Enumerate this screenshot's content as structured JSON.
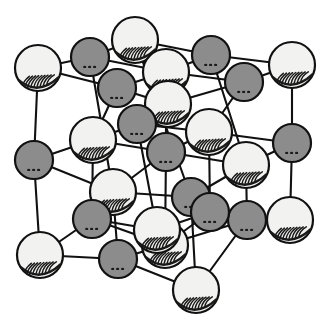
{
  "figure": {
    "background_color": "#ffffff",
    "line_color": "#111111",
    "projection": {
      "origin_x": 40,
      "origin_y": 255,
      "step_x": 78,
      "step_y": -96,
      "depth_dx": 46,
      "depth_dy": -48
    }
  },
  "species": [
    {
      "id": "anion",
      "label": "large light sphere",
      "fill_color": "#f2f2f0",
      "stroke_color": "#111111",
      "shade_color": "#1a1a1a",
      "radius": 23
    },
    {
      "id": "cation",
      "label": "small dark sphere",
      "fill_color": "#8c8c8c",
      "stroke_color": "#111111",
      "shade_color": "#1a1a1a",
      "radius": 19
    }
  ],
  "lattice": {
    "size_i": 3,
    "size_j": 3,
    "size_k": 3,
    "atom_count": 27,
    "bond_count": 54,
    "parity_rule": "sum of indices even -> anion (light), odd -> cation (dark)"
  },
  "atoms": [
    {
      "i": 0,
      "j": 0,
      "k": 0,
      "species": "anion",
      "x": 40,
      "y": 255
    },
    {
      "i": 1,
      "j": 0,
      "k": 0,
      "species": "cation",
      "x": 118,
      "y": 259
    },
    {
      "i": 2,
      "j": 0,
      "k": 0,
      "species": "anion",
      "x": 196,
      "y": 290
    },
    {
      "i": 0,
      "j": 1,
      "k": 0,
      "species": "cation",
      "x": 34,
      "y": 160
    },
    {
      "i": 1,
      "j": 1,
      "k": 0,
      "species": "anion",
      "x": 113,
      "y": 192
    },
    {
      "i": 2,
      "j": 1,
      "k": 0,
      "species": "cation",
      "x": 191,
      "y": 197
    },
    {
      "i": 0,
      "j": 2,
      "k": 0,
      "species": "anion",
      "x": 38,
      "y": 68
    },
    {
      "i": 1,
      "j": 2,
      "k": 0,
      "species": "cation",
      "x": 90,
      "y": 57
    },
    {
      "i": 2,
      "j": 2,
      "k": 0,
      "species": "anion",
      "x": 135,
      "y": 40
    },
    {
      "i": 0,
      "j": 0,
      "k": 1,
      "species": "cation",
      "x": 92,
      "y": 219
    },
    {
      "i": 1,
      "j": 0,
      "k": 1,
      "species": "anion",
      "x": 165,
      "y": 245
    },
    {
      "i": 2,
      "j": 0,
      "k": 1,
      "species": "cation",
      "x": 247,
      "y": 220
    },
    {
      "i": 0,
      "j": 1,
      "k": 1,
      "species": "anion",
      "x": 93,
      "y": 140
    },
    {
      "i": 1,
      "j": 1,
      "k": 1,
      "species": "cation",
      "x": 166,
      "y": 152
    },
    {
      "i": 2,
      "j": 1,
      "k": 1,
      "species": "anion",
      "x": 246,
      "y": 165
    },
    {
      "i": 0,
      "j": 2,
      "k": 1,
      "species": "cation",
      "x": 117,
      "y": 88
    },
    {
      "i": 1,
      "j": 2,
      "k": 1,
      "species": "anion",
      "x": 166,
      "y": 72
    },
    {
      "i": 2,
      "j": 2,
      "k": 1,
      "species": "cation",
      "x": 211,
      "y": 55
    },
    {
      "i": 0,
      "j": 0,
      "k": 2,
      "species": "anion",
      "x": 157,
      "y": 230
    },
    {
      "i": 1,
      "j": 0,
      "k": 2,
      "species": "cation",
      "x": 210,
      "y": 212
    },
    {
      "i": 2,
      "j": 0,
      "k": 2,
      "species": "anion",
      "x": 290,
      "y": 220
    },
    {
      "i": 0,
      "j": 1,
      "k": 2,
      "species": "cation",
      "x": 137,
      "y": 124
    },
    {
      "i": 1,
      "j": 1,
      "k": 2,
      "species": "anion",
      "x": 209,
      "y": 132
    },
    {
      "i": 2,
      "j": 1,
      "k": 2,
      "species": "cation",
      "x": 292,
      "y": 143
    },
    {
      "i": 0,
      "j": 2,
      "k": 2,
      "species": "anion",
      "x": 168,
      "y": 104
    },
    {
      "i": 1,
      "j": 2,
      "k": 2,
      "species": "cation",
      "x": 244,
      "y": 82
    },
    {
      "i": 2,
      "j": 2,
      "k": 2,
      "species": "anion",
      "x": 292,
      "y": 65
    }
  ]
}
